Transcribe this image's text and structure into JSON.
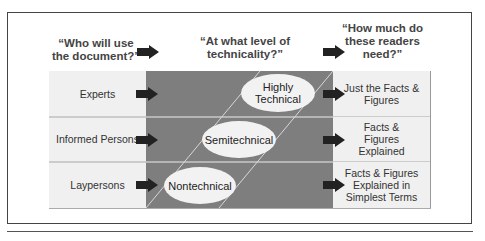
{
  "headers": {
    "col1": "“Who will use the document?”",
    "col2": "“At what level of technicality?”",
    "col3": "“How much do these readers need?”"
  },
  "rows": [
    {
      "reader": "Experts",
      "level": "Highly Technical",
      "need": "Just the Facts & Figures"
    },
    {
      "reader": "Informed Persons",
      "level": "Semitechnical",
      "need": "Facts & Figures Explained"
    },
    {
      "reader": "Laypersons",
      "level": "Nontechnical",
      "need": "Facts & Figures Explained in Simplest Terms"
    }
  ],
  "colors": {
    "light_cell": "#f0f0f0",
    "dark_band": "#7e7e7e",
    "arrow": "#222222",
    "ellipse": "#f2f2f2"
  }
}
